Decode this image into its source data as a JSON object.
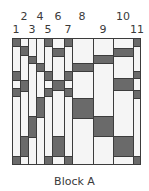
{
  "diagram": {
    "caption": "Block A",
    "colors": {
      "light": "#f5f5f5",
      "dark": "#6a6a6a",
      "outline": "#3c3c3c"
    },
    "column_labels": [
      {
        "text": "1",
        "x": 16,
        "row": 2
      },
      {
        "text": "2",
        "x": 24,
        "row": 1
      },
      {
        "text": "3",
        "x": 32,
        "row": 2
      },
      {
        "text": "4",
        "x": 40,
        "row": 1
      },
      {
        "text": "5",
        "x": 48,
        "row": 2
      },
      {
        "text": "6",
        "x": 58,
        "row": 1
      },
      {
        "text": "7",
        "x": 68,
        "row": 2
      },
      {
        "text": "8",
        "x": 82,
        "row": 1
      },
      {
        "text": "9",
        "x": 103,
        "row": 2
      },
      {
        "text": "10",
        "x": 123,
        "row": 1
      },
      {
        "text": "11",
        "x": 137,
        "row": 2
      }
    ],
    "columns": [
      {
        "id": 1,
        "x0": 12,
        "x1": 20,
        "segments": [
          [
            "d",
            38,
            46
          ],
          [
            "l",
            46,
            71
          ],
          [
            "d",
            71,
            80
          ],
          [
            "l",
            80,
            88
          ],
          [
            "d",
            88,
            96
          ],
          [
            "l",
            96,
            156
          ],
          [
            "d",
            156,
            164
          ]
        ]
      },
      {
        "id": 2,
        "x0": 20,
        "x1": 28,
        "segments": [
          [
            "l",
            38,
            46
          ],
          [
            "d",
            46,
            55
          ],
          [
            "l",
            55,
            80
          ],
          [
            "d",
            80,
            91
          ],
          [
            "l",
            91,
            136
          ],
          [
            "d",
            136,
            156
          ],
          [
            "l",
            156,
            164
          ]
        ]
      },
      {
        "id": 3,
        "x0": 28,
        "x1": 36,
        "segments": [
          [
            "l",
            38,
            56
          ],
          [
            "d",
            56,
            63
          ],
          [
            "l",
            63,
            116
          ],
          [
            "d",
            116,
            137
          ],
          [
            "l",
            137,
            164
          ]
        ]
      },
      {
        "id": 4,
        "x0": 36,
        "x1": 44,
        "segments": [
          [
            "l",
            38,
            63
          ],
          [
            "d",
            63,
            71
          ],
          [
            "l",
            71,
            97
          ],
          [
            "d",
            97,
            117
          ],
          [
            "l",
            117,
            164
          ]
        ]
      },
      {
        "id": 5,
        "x0": 44,
        "x1": 52,
        "segments": [
          [
            "d",
            38,
            46
          ],
          [
            "l",
            46,
            71
          ],
          [
            "d",
            71,
            80
          ],
          [
            "l",
            80,
            88
          ],
          [
            "d",
            88,
            96
          ],
          [
            "l",
            96,
            156
          ],
          [
            "d",
            156,
            164
          ]
        ]
      },
      {
        "id": 6,
        "x0": 52,
        "x1": 64,
        "segments": [
          [
            "l",
            38,
            48
          ],
          [
            "d",
            48,
            56
          ],
          [
            "l",
            56,
            80
          ],
          [
            "d",
            80,
            90
          ],
          [
            "l",
            90,
            136
          ],
          [
            "d",
            136,
            156
          ],
          [
            "l",
            156,
            164
          ]
        ]
      },
      {
        "id": 7,
        "x0": 64,
        "x1": 72,
        "segments": [
          [
            "d",
            38,
            46
          ],
          [
            "l",
            46,
            71
          ],
          [
            "d",
            71,
            80
          ],
          [
            "l",
            80,
            88
          ],
          [
            "d",
            88,
            96
          ],
          [
            "l",
            96,
            156
          ],
          [
            "d",
            156,
            164
          ]
        ]
      },
      {
        "id": 8,
        "x0": 72,
        "x1": 93,
        "segments": [
          [
            "l",
            38,
            63
          ],
          [
            "d",
            63,
            71
          ],
          [
            "l",
            71,
            98
          ],
          [
            "d",
            98,
            118
          ],
          [
            "l",
            118,
            164
          ]
        ]
      },
      {
        "id": 9,
        "x0": 93,
        "x1": 113,
        "segments": [
          [
            "l",
            38,
            55
          ],
          [
            "d",
            55,
            63
          ],
          [
            "l",
            63,
            116
          ],
          [
            "d",
            116,
            136
          ],
          [
            "l",
            136,
            164
          ]
        ]
      },
      {
        "id": 10,
        "x0": 113,
        "x1": 133,
        "segments": [
          [
            "l",
            38,
            48
          ],
          [
            "d",
            48,
            56
          ],
          [
            "l",
            56,
            78
          ],
          [
            "d",
            78,
            90
          ],
          [
            "l",
            90,
            136
          ],
          [
            "d",
            136,
            156
          ],
          [
            "l",
            156,
            164
          ]
        ]
      },
      {
        "id": 11,
        "x0": 133,
        "x1": 140,
        "segments": [
          [
            "d",
            38,
            46
          ],
          [
            "l",
            46,
            71
          ],
          [
            "d",
            71,
            78
          ],
          [
            "l",
            78,
            90
          ],
          [
            "d",
            90,
            98
          ],
          [
            "l",
            98,
            156
          ],
          [
            "d",
            156,
            164
          ]
        ]
      }
    ]
  }
}
